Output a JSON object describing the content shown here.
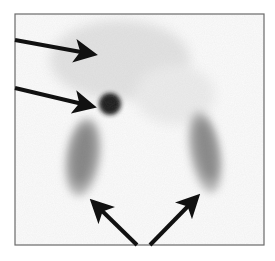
{
  "image": {
    "description": "Grayscale nuclear scintigraphy scan with a dark focal hot spot, faint diffuse uptake, and two elongated organ-shaped uptake regions, indicated by four black arrows",
    "background_color": "#fbfbfb",
    "frame_color": "#6a6a6a"
  },
  "arrows": [
    {
      "id": "arrow-upper-left-1",
      "points_to": "faint diffuse uptake",
      "tail": [
        15,
        40
      ],
      "tip": [
        99,
        55
      ]
    },
    {
      "id": "arrow-upper-left-2",
      "points_to": "focal hot spot",
      "tail": [
        15,
        88
      ],
      "tip": [
        98,
        108
      ]
    },
    {
      "id": "arrow-bottom-left",
      "points_to": "left elongated uptake",
      "tail": [
        137,
        245
      ],
      "tip": [
        89,
        198
      ]
    },
    {
      "id": "arrow-bottom-right",
      "points_to": "right elongated uptake",
      "tail": [
        150,
        245
      ],
      "tip": [
        201,
        193
      ]
    }
  ],
  "regions": [
    {
      "id": "hot-spot",
      "cx": 110,
      "cy": 104,
      "r": 10,
      "color": "#1c1c1c"
    },
    {
      "id": "left-uptake",
      "cx": 83,
      "cy": 157,
      "rx": 16,
      "ry": 38,
      "rotate": 8,
      "color": "#7a7a7a"
    },
    {
      "id": "right-uptake",
      "cx": 205,
      "cy": 152,
      "rx": 15,
      "ry": 40,
      "rotate": -10,
      "color": "#7e7e7e"
    },
    {
      "id": "faint-uptake",
      "cx": 120,
      "cy": 60,
      "rx": 70,
      "ry": 40,
      "color": "#e4e4e4"
    }
  ]
}
